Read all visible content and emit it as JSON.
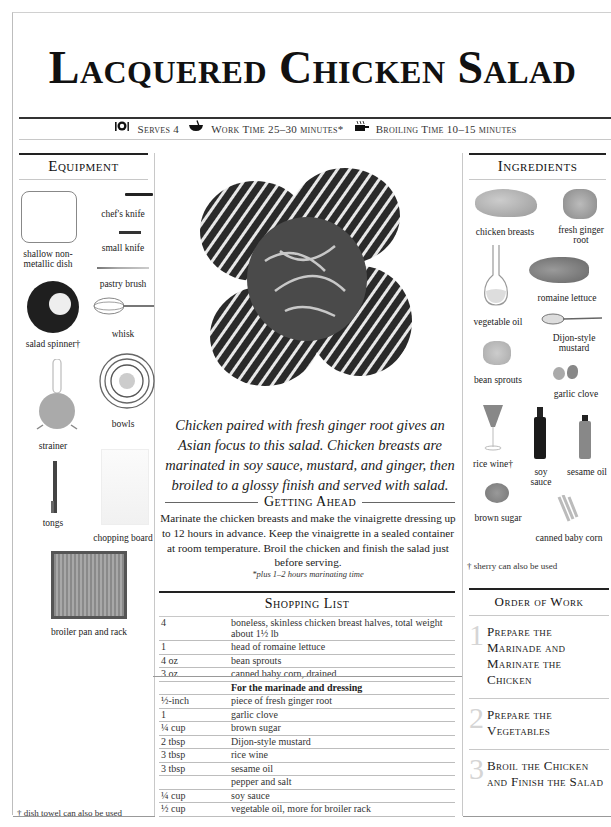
{
  "title": "Lacquered Chicken Salad",
  "meta": {
    "serves": "Serves 4",
    "work_time": "Work Time 25–30 minutes*",
    "broiling_time": "Broiling Time 10–15 minutes",
    "icons": [
      "place-setting-icon",
      "bowl-whisk-icon",
      "broiler-icon"
    ]
  },
  "equipment": {
    "heading": "Equipment",
    "items": [
      {
        "label": "shallow non-metallic dish",
        "icon": "dish-icon"
      },
      {
        "label": "chef's knife",
        "icon": "chefs-knife-icon"
      },
      {
        "label": "small knife",
        "icon": "small-knife-icon"
      },
      {
        "label": "pastry brush",
        "icon": "pastry-brush-icon"
      },
      {
        "label": "salad spinner†",
        "icon": "salad-spinner-icon"
      },
      {
        "label": "whisk",
        "icon": "whisk-icon"
      },
      {
        "label": "bowls",
        "icon": "bowls-icon"
      },
      {
        "label": "strainer",
        "icon": "strainer-icon"
      },
      {
        "label": "tongs",
        "icon": "tongs-icon"
      },
      {
        "label": "chopping board",
        "icon": "chopping-board-icon"
      },
      {
        "label": "broiler pan and rack",
        "icon": "broiler-pan-icon"
      }
    ],
    "footnote": "† dish towel can also be used"
  },
  "main": {
    "photo": "lacquered-chicken-salad-photo",
    "caption": "Chicken paired with fresh ginger root gives an Asian focus to this salad. Chicken breasts are marinated in soy sauce, mustard, and ginger, then broiled to a glossy finish and served with salad.",
    "getting_ahead": {
      "heading": "Getting Ahead",
      "body": "Marinate the chicken breasts and make the vinaigrette dressing up to 12 hours in advance. Keep the vinaigrette in a sealed container at room temperature. Broil the chicken and finish the salad just before serving.",
      "note": "*plus 1–2 hours marinating time"
    },
    "shopping_list": {
      "heading": "Shopping List",
      "rows": [
        {
          "qty": "4",
          "item": "boneless, skinless chicken breast halves, total weight about 1½ lb"
        },
        {
          "qty": "1",
          "item": "head of romaine lettuce"
        },
        {
          "qty": "4 oz",
          "item": "bean sprouts"
        },
        {
          "qty": "3 oz",
          "item": "canned baby corn, drained"
        },
        {
          "qty": "",
          "item": "For the marinade and dressing",
          "subheading": true
        },
        {
          "qty": "½-inch",
          "item": "piece of fresh ginger root"
        },
        {
          "qty": "1",
          "item": "garlic clove"
        },
        {
          "qty": "¼ cup",
          "item": "brown sugar"
        },
        {
          "qty": "2 tbsp",
          "item": "Dijon-style mustard"
        },
        {
          "qty": "3 tbsp",
          "item": "rice wine"
        },
        {
          "qty": "3 tbsp",
          "item": "sesame oil"
        },
        {
          "qty": "",
          "item": "pepper and salt"
        },
        {
          "qty": "¼ cup",
          "item": "soy sauce"
        },
        {
          "qty": "½ cup",
          "item": "vegetable oil, more for broiler rack"
        }
      ]
    }
  },
  "ingredients": {
    "heading": "Ingredients",
    "items": [
      {
        "label": "chicken breasts",
        "icon": "chicken-breast-icon"
      },
      {
        "label": "fresh ginger root",
        "icon": "ginger-icon"
      },
      {
        "label": "romaine lettuce",
        "icon": "lettuce-icon"
      },
      {
        "label": "vegetable oil",
        "icon": "oil-carafe-icon"
      },
      {
        "label": "Dijon-style mustard",
        "icon": "mustard-spoon-icon"
      },
      {
        "label": "bean sprouts",
        "icon": "bean-sprouts-icon"
      },
      {
        "label": "garlic clove",
        "icon": "garlic-icon"
      },
      {
        "label": "rice wine†",
        "icon": "wine-glass-icon"
      },
      {
        "label": "soy sauce",
        "icon": "soy-bottle-icon"
      },
      {
        "label": "sesame oil",
        "icon": "sesame-bottle-icon"
      },
      {
        "label": "brown sugar",
        "icon": "brown-sugar-icon"
      },
      {
        "label": "canned baby corn",
        "icon": "baby-corn-icon"
      }
    ],
    "footnote": "† sherry can also be used"
  },
  "order_of_work": {
    "heading": "Order of Work",
    "steps": [
      {
        "num": "1",
        "label": "Prepare the Marinade and Marinate the Chicken"
      },
      {
        "num": "2",
        "label": "Prepare the Vegetables"
      },
      {
        "num": "3",
        "label": "Broil the Chicken and Finish the Salad"
      }
    ]
  }
}
